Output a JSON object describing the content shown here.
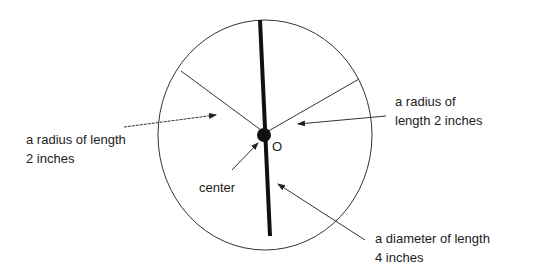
{
  "diagram": {
    "center_label": "O",
    "labels": {
      "radius_left": {
        "line1": "a radius of length",
        "line2": "2 inches"
      },
      "radius_right": {
        "line1": "a radius of",
        "line2": "length 2 inches"
      },
      "center": "center",
      "diameter": {
        "line1": "a diameter of length",
        "line2": "4 inches"
      }
    },
    "colors": {
      "stroke": "#222222",
      "background": "#ffffff",
      "text": "#222222"
    }
  }
}
